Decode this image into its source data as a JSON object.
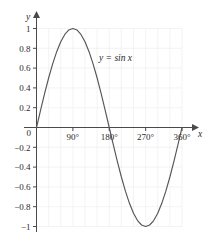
{
  "chart_data": {
    "type": "line",
    "title": "",
    "subtitle": "",
    "xlabel": "x",
    "ylabel": "y",
    "xlim": [
      0,
      360
    ],
    "ylim": [
      -1,
      1
    ],
    "grid": true,
    "legend_position": "inline-annotation",
    "annotations": [
      {
        "text": "y = sin x",
        "x": 170,
        "y": 0.72
      }
    ],
    "x_tick_labels": [
      "90°",
      "180°",
      "270°",
      "360°"
    ],
    "x_tick_values": [
      90,
      180,
      270,
      360
    ],
    "y_tick_labels": [
      "1",
      "0.8",
      "0.6",
      "0.4",
      "0.2",
      "0",
      "−0.2",
      "−0.4",
      "−0.6",
      "−0.8",
      "−1"
    ],
    "y_tick_values": [
      1,
      0.8,
      0.6,
      0.4,
      0.2,
      0,
      -0.2,
      -0.4,
      -0.6,
      -0.8,
      -1
    ],
    "origin_label": "0",
    "series": [
      {
        "name": "y = sin x",
        "color": "#56565a",
        "x": [
          0,
          10,
          20,
          30,
          40,
          50,
          60,
          70,
          80,
          90,
          100,
          110,
          120,
          130,
          140,
          150,
          160,
          170,
          180,
          190,
          200,
          210,
          220,
          230,
          240,
          250,
          260,
          270,
          280,
          290,
          300,
          310,
          320,
          330,
          340,
          350,
          360
        ],
        "values": [
          0,
          0.174,
          0.342,
          0.5,
          0.643,
          0.766,
          0.866,
          0.94,
          0.985,
          1,
          0.985,
          0.94,
          0.866,
          0.766,
          0.643,
          0.5,
          0.342,
          0.174,
          0,
          -0.174,
          -0.342,
          -0.5,
          -0.643,
          -0.766,
          -0.866,
          -0.94,
          -0.985,
          -1,
          -0.985,
          -0.94,
          -0.866,
          -0.766,
          -0.643,
          -0.5,
          -0.342,
          -0.174,
          0
        ]
      }
    ]
  },
  "axes": {
    "y_axis_name": "y",
    "x_axis_name": "x"
  }
}
